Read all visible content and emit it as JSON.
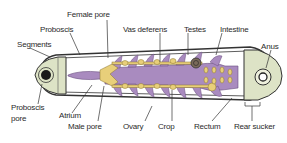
{
  "diagram": {
    "labels": {
      "female_pore": "Female pore",
      "proboscis": "Proboscis",
      "segments": "Segments",
      "vas_deferens": "Vas deferens",
      "testes": "Testes",
      "intestine": "Intestine",
      "anus": "Anus",
      "proboscis_pore_1": "Proboscis",
      "proboscis_pore_2": "pore",
      "atrium": "Atrium",
      "male_pore": "Male pore",
      "ovary": "Ovary",
      "crop": "Crop",
      "rectum": "Rectum",
      "rear_sucker": "Rear sucker"
    },
    "colors": {
      "crop_purple": "#a98bbf",
      "reproductive_yellow": "#e8cf7a",
      "sucker_green": "#dde3c6",
      "outline": "#333333"
    }
  }
}
